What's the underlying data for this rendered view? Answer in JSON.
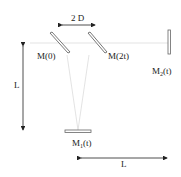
{
  "diagram": {
    "labels": {
      "separation": "2 D",
      "mirror_0": "M(0)",
      "mirror_2t": "M(2t)",
      "mirror_2_base": "M",
      "mirror_2_sub": "2",
      "mirror_2_arg": "(t)",
      "mirror_1_base": "M",
      "mirror_1_sub": "1",
      "mirror_1_arg": "(t)",
      "vertical_length": "L",
      "horizontal_length": "L"
    },
    "colors": {
      "line": "#222222",
      "beam": "#d8d8d8",
      "mirror_fill": "#ffffff"
    }
  }
}
